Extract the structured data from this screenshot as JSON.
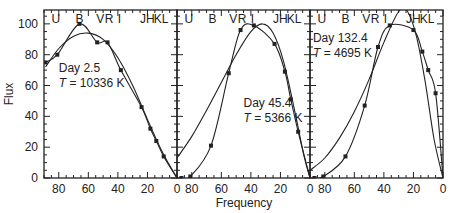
{
  "chart_data": {
    "type": "line",
    "ylabel": "Flux",
    "xlabel": "Frequency",
    "ylim": [
      0,
      109
    ],
    "xlim": [
      90,
      0
    ],
    "yticks": [
      0,
      20,
      40,
      60,
      80,
      100
    ],
    "xticks": [
      80,
      60,
      40,
      20,
      0
    ],
    "band_labels": [
      {
        "label": "U",
        "freq": 82
      },
      {
        "label": "B",
        "freq": 66
      },
      {
        "label": "V",
        "freq": 52
      },
      {
        "label": "R",
        "freq": 46
      },
      {
        "label": "I",
        "freq": 39
      },
      {
        "label": "J",
        "freq": 23
      },
      {
        "label": "H",
        "freq": 18
      },
      {
        "label": "K",
        "freq": 13
      },
      {
        "label": "L",
        "freq": 8
      }
    ],
    "panels": [
      {
        "day_label": "Day  2.5",
        "temp_label": "T = 10336 K",
        "day": 2.5,
        "temperature_K": 10336,
        "annotation_pos": {
          "freq": 80,
          "flux": 69
        },
        "series": [
          {
            "name": "observed",
            "markers": true,
            "x": [
              89,
              81,
              66,
              54,
              47,
              38,
              24,
              18,
              14,
              9,
              0
            ],
            "y": [
              75,
              80,
              100,
              88,
              88,
              70,
              46,
              32,
              24,
              14,
              0
            ]
          },
          {
            "name": "blackbody fit",
            "markers": false,
            "x": [
              89,
              80,
              70,
              60,
              50,
              40,
              30,
              20,
              10,
              0
            ],
            "y": [
              72,
              84,
              92,
              94,
              90,
              78,
              60,
              38,
              17,
              0
            ]
          }
        ]
      },
      {
        "day_label": "Day  45.4",
        "temp_label": "T = 5366 K",
        "day": 45.4,
        "temperature_K": 5366,
        "annotation_pos": {
          "freq": 45,
          "flux": 46
        },
        "series": [
          {
            "name": "observed",
            "markers": true,
            "x": [
              87,
              81,
              67,
              55,
              47,
              38,
              24,
              17,
              13,
              8,
              0
            ],
            "y": [
              0,
              1,
              21,
              68,
              96,
              99,
              87,
              69,
              51,
              30,
              0
            ]
          },
          {
            "name": "blackbody fit",
            "markers": false,
            "x": [
              90,
              80,
              70,
              60,
              50,
              40,
              32,
              25,
              18,
              10,
              4,
              0
            ],
            "y": [
              13,
              27,
              44,
              62,
              80,
              95,
              100,
              94,
              76,
              42,
              14,
              0
            ]
          }
        ]
      },
      {
        "day_label": "Day  132.4",
        "temp_label": "T = 4695 K",
        "day": 132.4,
        "temperature_K": 4695,
        "annotation_pos": {
          "freq": 88,
          "flux": 88
        },
        "series": [
          {
            "name": "observed",
            "markers": true,
            "x": [
              87,
              81,
              66,
              53,
              44,
              36,
              20,
              14,
              10,
              5,
              0
            ],
            "y": [
              0,
              1,
              14,
              47,
              85,
              99,
              96,
              82,
              70,
              55,
              0
            ]
          },
          {
            "name": "blackbody fit",
            "markers": false,
            "x": [
              90,
              80,
              70,
              60,
              50,
              40,
              30,
              24,
              18,
              12,
              6,
              0
            ],
            "y": [
              5,
              13,
              26,
              43,
              64,
              88,
              108,
              108,
              92,
              62,
              25,
              0
            ]
          }
        ]
      }
    ]
  }
}
